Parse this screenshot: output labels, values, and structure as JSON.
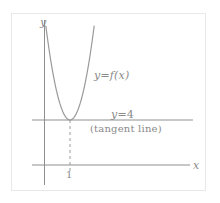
{
  "figure": {
    "kind": "math-diagram",
    "background_color": "#ffffff",
    "frame_color": "#e8e8e8",
    "ink_color": "#8a8a8a",
    "axis_color": "#8f8f8f",
    "curve_color": "#9a9a9a"
  },
  "axes": {
    "y_axis_label": "y",
    "x_axis_label": "x",
    "x_tick_label": "1"
  },
  "labels": {
    "curve_label_y": "y",
    "curve_label_eq": "=",
    "curve_label_fx": "f(x)",
    "tangent_value_y": "y",
    "tangent_value_eq": "=",
    "tangent_value_num": "4",
    "tangent_note": "(tangent line)"
  },
  "chart_data": {
    "type": "line",
    "title": "",
    "xlabel": "x",
    "ylabel": "y",
    "grid": false,
    "legend": "none",
    "xlim": [
      -1,
      4.2
    ],
    "ylim": [
      0,
      14
    ],
    "annotations": [
      {
        "text": "y = f(x)",
        "x": 2.1,
        "y": 9.2
      },
      {
        "text": "y = 4",
        "x": 2.9,
        "y": 4.7
      },
      {
        "text": "(tangent line)",
        "x": 2.5,
        "y": 3.4
      },
      {
        "text": "1",
        "x": 1.0,
        "y": -0.9
      }
    ],
    "series": [
      {
        "name": "y = f(x)",
        "type": "parabola",
        "vertex": [
          1,
          4
        ],
        "opens": "up",
        "description": "Upward parabola tangent to the horizontal line y = 4 at its vertex (1, 4)",
        "x": [
          -0.1,
          0.2,
          0.5,
          0.8,
          1.0,
          1.2,
          1.5,
          1.8,
          2.1,
          2.4
        ],
        "y": [
          13.3,
          9.8,
          7.0,
          4.8,
          4.0,
          4.8,
          7.0,
          9.8,
          13.3,
          17.4
        ]
      },
      {
        "name": "y = 4",
        "type": "horizontal-line",
        "value": 4,
        "style": "solid",
        "role": "tangent line"
      },
      {
        "name": "x = 1",
        "type": "vertical-segment",
        "value": 1,
        "from_y": 0,
        "to_y": 4,
        "style": "dashed",
        "role": "vertex drop line"
      }
    ]
  }
}
